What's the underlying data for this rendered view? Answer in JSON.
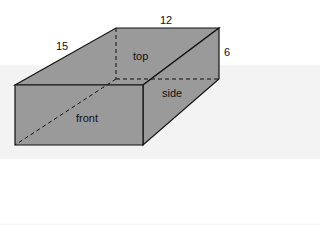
{
  "diagram": {
    "type": "rectangular-prism",
    "dimensions": {
      "length": "15",
      "width": "12",
      "height": "6"
    },
    "face_labels": {
      "top": "top",
      "side": "side",
      "front": "front"
    },
    "colors": {
      "face_fill": "#9a9a9a",
      "edge": "#111111",
      "background": "#ffffff"
    }
  }
}
